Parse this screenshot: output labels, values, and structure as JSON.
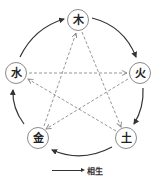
{
  "diagram": {
    "title": "",
    "nodes": [
      {
        "id": "wood",
        "label": "木",
        "x": 78,
        "y": 20
      },
      {
        "id": "fire",
        "label": "火",
        "x": 140,
        "y": 73
      },
      {
        "id": "earth",
        "label": "土",
        "x": 126,
        "y": 138
      },
      {
        "id": "metal",
        "label": "金",
        "x": 38,
        "y": 138
      },
      {
        "id": "water",
        "label": "水",
        "x": 16,
        "y": 73
      }
    ],
    "generating_cycle": {
      "style": "solid-curved-arrow",
      "edges": [
        {
          "from": "木",
          "to": "火"
        },
        {
          "from": "火",
          "to": "土"
        },
        {
          "from": "土",
          "to": "金"
        },
        {
          "from": "金",
          "to": "水"
        },
        {
          "from": "水",
          "to": "木"
        }
      ]
    },
    "controlling_cycle": {
      "style": "dashed-straight-arrow",
      "edges": [
        {
          "from": "木",
          "to": "土"
        },
        {
          "from": "土",
          "to": "水"
        },
        {
          "from": "水",
          "to": "火"
        },
        {
          "from": "火",
          "to": "金"
        },
        {
          "from": "金",
          "to": "木"
        }
      ]
    },
    "legend": {
      "items": [
        {
          "symbol": "solid-arrow",
          "label": "相生"
        }
      ]
    },
    "colors": {
      "solid_line": "#333333",
      "dashed_line": "#8a8a8a",
      "node_border": "#8a8a8a",
      "text": "#222222"
    }
  }
}
